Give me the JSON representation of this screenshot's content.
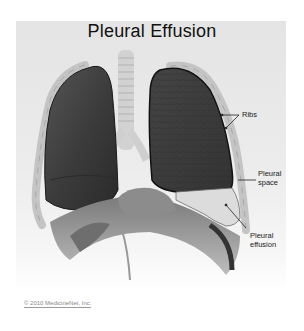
{
  "figure": {
    "title": "Pleural Effusion",
    "labels": {
      "ribs": "Ribs",
      "pleural_space_line1": "Pleural",
      "pleural_space_line2": "space",
      "pleural_effusion_line1": "Pleural",
      "pleural_effusion_line2": "effusion"
    },
    "copyright": "© 2010 MedicineNet, Inc."
  },
  "colors": {
    "panel_bg": "#e8e8e8",
    "lung_dark": "#3a3a3a",
    "rib": "#c9c9c9",
    "effusion_fluid": "#d8d8d8"
  }
}
